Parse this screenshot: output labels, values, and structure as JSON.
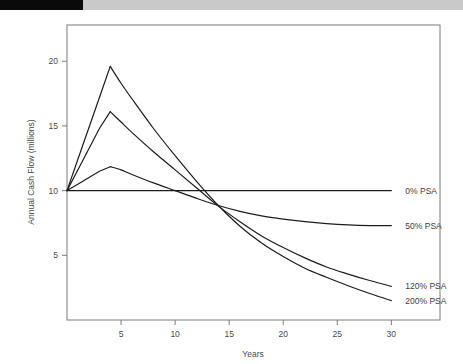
{
  "figure": {
    "background_color": "#ffffff",
    "frame_color": "#7a7a7a",
    "line_color": "#1c1c1c",
    "text_color": "#4a4a4a",
    "header_bar": {
      "black_color": "#0a0a0a",
      "gray_color": "#c9c9c9"
    }
  },
  "chart_data": {
    "type": "line",
    "title": "",
    "xlabel": "Years",
    "ylabel": "Annual Cash Flow (millions)",
    "xlim": [
      0,
      34.5
    ],
    "ylim": [
      0,
      22.8
    ],
    "xticks": [
      5,
      10,
      15,
      20,
      25,
      30
    ],
    "xtick_labels": [
      "5",
      "10",
      "15",
      "20",
      "25",
      "30"
    ],
    "yticks": [
      5,
      10,
      15,
      20
    ],
    "ytick_labels": [
      "5",
      "10",
      "15",
      "20"
    ],
    "grid": false,
    "legend_position": "right-inline-labels",
    "series": [
      {
        "name": "0% PSA",
        "label": "0% PSA",
        "label_value_x": 30,
        "label_value_y": 10,
        "x": [
          0,
          5,
          10,
          15,
          20,
          25,
          30
        ],
        "values": [
          10.0,
          10.0,
          10.0,
          10.0,
          10.0,
          10.0,
          10.0
        ]
      },
      {
        "name": "50% PSA",
        "label": "50% PSA",
        "label_value_x": 30,
        "label_value_y": 7.3,
        "x": [
          0,
          1,
          2,
          3,
          4,
          5,
          6,
          8,
          10,
          12,
          14,
          16,
          18,
          20,
          22,
          24,
          26,
          28,
          30
        ],
        "values": [
          10.0,
          10.5,
          11.0,
          11.5,
          11.85,
          11.6,
          11.25,
          10.6,
          10.0,
          9.4,
          8.85,
          8.4,
          8.05,
          7.8,
          7.6,
          7.45,
          7.35,
          7.3,
          7.3
        ]
      },
      {
        "name": "120% PSA",
        "label": "120% PSA",
        "label_value_x": 30,
        "label_value_y": 2.6,
        "x": [
          0,
          1,
          2,
          3,
          4,
          5,
          6,
          8,
          10,
          12,
          14,
          16,
          18,
          20,
          22,
          24,
          26,
          28,
          30
        ],
        "values": [
          10.0,
          11.6,
          13.2,
          14.8,
          16.1,
          15.3,
          14.5,
          13.0,
          11.6,
          10.2,
          8.8,
          7.6,
          6.5,
          5.6,
          4.8,
          4.1,
          3.55,
          3.05,
          2.6
        ]
      },
      {
        "name": "200% PSA",
        "label": "200% PSA",
        "label_value_x": 30,
        "label_value_y": 1.5,
        "x": [
          0,
          1,
          2,
          3,
          4,
          5,
          6,
          8,
          10,
          12,
          14,
          16,
          18,
          20,
          22,
          24,
          26,
          28,
          30
        ],
        "values": [
          10.0,
          12.4,
          14.8,
          17.2,
          19.6,
          18.3,
          17.1,
          14.8,
          12.7,
          10.7,
          8.85,
          7.25,
          5.95,
          4.9,
          4.0,
          3.3,
          2.65,
          2.05,
          1.5
        ]
      }
    ],
    "annotations": [
      {
        "text": "0% PSA",
        "x": 30,
        "y": 10
      },
      {
        "text": "50% PSA",
        "x": 30,
        "y": 7.3
      },
      {
        "text": "120% PSA",
        "x": 30,
        "y": 2.6
      },
      {
        "text": "200% PSA",
        "x": 30,
        "y": 1.5
      }
    ]
  }
}
